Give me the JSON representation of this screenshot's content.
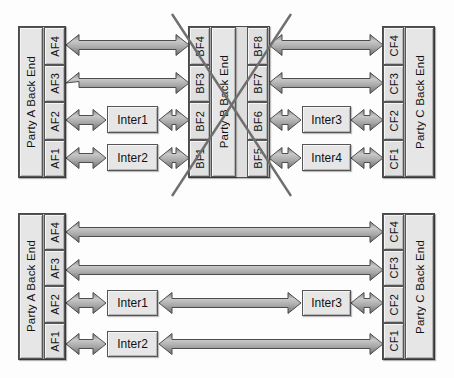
{
  "figure": {
    "title": "",
    "type": "block-connection-diagram",
    "panels": [
      {
        "id": "top",
        "crossed_out": true,
        "crossed_out_target": "party-b-back-end",
        "parties": [
          {
            "id": "party-a",
            "label": "Party A Back End",
            "side": "left",
            "interfaces": [
              "AF4",
              "AF3",
              "AF2",
              "AF1"
            ]
          },
          {
            "id": "party-b",
            "label": "Party B Back End",
            "side": "center",
            "interfaces_left": [
              "BF4",
              "BF3",
              "BF2",
              "BF1"
            ],
            "interfaces_right": [
              "BF8",
              "BF7",
              "BF6",
              "BF5"
            ]
          },
          {
            "id": "party-c",
            "label": "Party C Back End",
            "side": "right",
            "interfaces": [
              "CF4",
              "CF3",
              "CF2",
              "CF1"
            ]
          }
        ],
        "intermediaries": [
          {
            "id": "inter1",
            "label": "Inter1",
            "row": 3,
            "side": "left"
          },
          {
            "id": "inter2",
            "label": "Inter2",
            "row": 4,
            "side": "left"
          },
          {
            "id": "inter3",
            "label": "Inter3",
            "row": 3,
            "side": "right"
          },
          {
            "id": "inter4",
            "label": "Inter4",
            "row": 4,
            "side": "right"
          }
        ],
        "connections": [
          {
            "from": "AF4",
            "to": "BF4",
            "style": "double-arrow"
          },
          {
            "from": "AF3",
            "to": "BF3",
            "style": "double-arrow"
          },
          {
            "from": "AF2",
            "to": "Inter1",
            "style": "double-arrow"
          },
          {
            "from": "Inter1",
            "to": "BF2",
            "style": "double-arrow"
          },
          {
            "from": "AF1",
            "to": "Inter2",
            "style": "double-arrow"
          },
          {
            "from": "Inter2",
            "to": "BF1",
            "style": "double-arrow"
          },
          {
            "from": "BF8",
            "to": "CF4",
            "style": "double-arrow"
          },
          {
            "from": "BF7",
            "to": "CF3",
            "style": "double-arrow"
          },
          {
            "from": "BF6",
            "to": "Inter3",
            "style": "double-arrow"
          },
          {
            "from": "Inter3",
            "to": "CF2",
            "style": "double-arrow"
          },
          {
            "from": "BF5",
            "to": "Inter4",
            "style": "double-arrow"
          },
          {
            "from": "Inter4",
            "to": "CF1",
            "style": "double-arrow"
          }
        ]
      },
      {
        "id": "bottom",
        "crossed_out": false,
        "parties": [
          {
            "id": "party-a",
            "label": "Party A Back End",
            "side": "left",
            "interfaces": [
              "AF4",
              "AF3",
              "AF2",
              "AF1"
            ]
          },
          {
            "id": "party-c",
            "label": "Party C Back End",
            "side": "right",
            "interfaces": [
              "CF4",
              "CF3",
              "CF2",
              "CF1"
            ]
          }
        ],
        "intermediaries": [
          {
            "id": "inter1",
            "label": "Inter1",
            "row": 3,
            "side": "left"
          },
          {
            "id": "inter2",
            "label": "Inter2",
            "row": 4,
            "side": "left"
          },
          {
            "id": "inter3",
            "label": "Inter3",
            "row": 3,
            "side": "right"
          }
        ],
        "connections": [
          {
            "from": "AF4",
            "to": "CF4",
            "style": "double-arrow"
          },
          {
            "from": "AF3",
            "to": "CF3",
            "style": "double-arrow"
          },
          {
            "from": "AF2",
            "to": "Inter1",
            "style": "double-arrow"
          },
          {
            "from": "Inter1",
            "to": "Inter3",
            "style": "double-arrow"
          },
          {
            "from": "Inter3",
            "to": "CF2",
            "style": "double-arrow"
          },
          {
            "from": "AF1",
            "to": "Inter2",
            "style": "double-arrow"
          },
          {
            "from": "Inter2",
            "to": "CF1",
            "style": "double-arrow"
          }
        ]
      }
    ]
  },
  "colors": {
    "box_fill": "#e2e2e2",
    "box_stroke": "#555555",
    "arrow_light": "#b8b8b8",
    "arrow_dark": "#6e6e6e",
    "arrow_stroke": "#4d4d4d",
    "cross_stroke": "#6f6f6f",
    "background": "#fdfdfd"
  },
  "labels": {
    "top": {
      "party_a": "Party A Back End",
      "party_b": "Party B Back End",
      "party_c": "Party C Back End",
      "af4": "AF4",
      "af3": "AF3",
      "af2": "AF2",
      "af1": "AF1",
      "bf4": "BF4",
      "bf3": "BF3",
      "bf2": "BF2",
      "bf1": "BF1",
      "bf8": "BF8",
      "bf7": "BF7",
      "bf6": "BF6",
      "bf5": "BF5",
      "cf4": "CF4",
      "cf3": "CF3",
      "cf2": "CF2",
      "cf1": "CF1",
      "inter1": "Inter1",
      "inter2": "Inter2",
      "inter3": "Inter3",
      "inter4": "Inter4"
    },
    "bottom": {
      "party_a": "Party A Back End",
      "party_c": "Party C Back End",
      "af4": "AF4",
      "af3": "AF3",
      "af2": "AF2",
      "af1": "AF1",
      "cf4": "CF4",
      "cf3": "CF3",
      "cf2": "CF2",
      "cf1": "CF1",
      "inter1": "Inter1",
      "inter2": "Inter2",
      "inter3": "Inter3"
    }
  }
}
